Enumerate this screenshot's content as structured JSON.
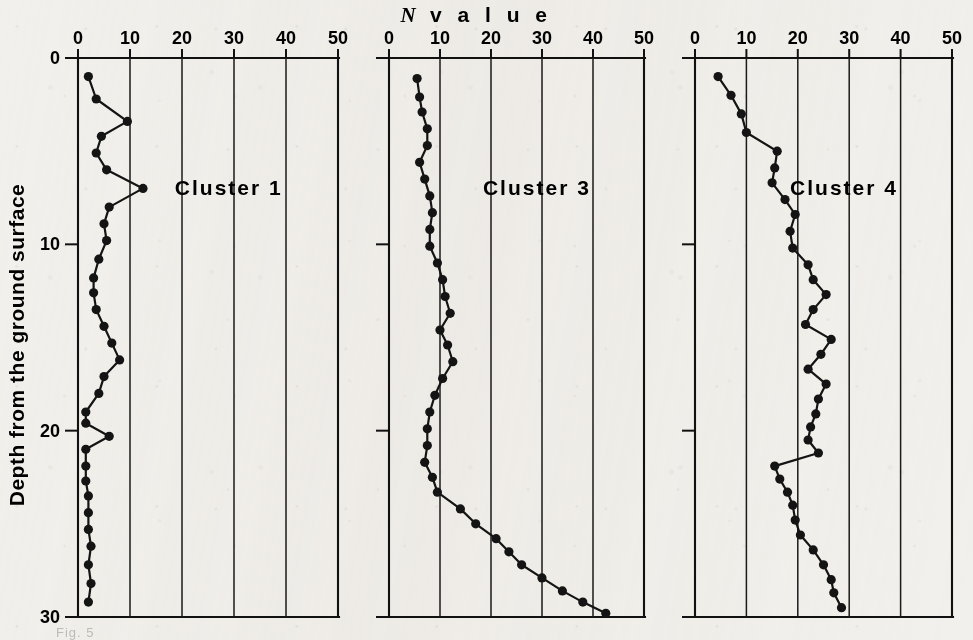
{
  "figure": {
    "title_italic": "N",
    "title_rest": "v a l u e",
    "ylabel": "Depth from the ground surface",
    "caption_partial": "Fig. 5"
  },
  "axis": {
    "x_ticks": [
      "0",
      "10",
      "20",
      "30",
      "40",
      "50"
    ],
    "x_tick_values": [
      0,
      10,
      20,
      30,
      40,
      50
    ],
    "y_ticks": [
      "0",
      "10",
      "20",
      "30"
    ],
    "y_tick_values": [
      0,
      10,
      20,
      30
    ],
    "xlim": [
      0,
      50
    ],
    "ylim": [
      0,
      30
    ],
    "colors": {
      "ink": "#141414",
      "paper": "#f2f0ec",
      "grid": "#1a1a1a"
    }
  },
  "chart_data": {
    "type": "line",
    "xlabel": "N value",
    "ylabel": "Depth from the ground surface",
    "xlim": [
      0,
      50
    ],
    "ylim": [
      0,
      30
    ],
    "y_inverted": true,
    "grid": true,
    "legend": "none",
    "panels": [
      {
        "label": "Cluster 1",
        "x": [
          2.0,
          3.5,
          9.5,
          4.5,
          3.5,
          5.5,
          12.5,
          6.0,
          5.0,
          5.5,
          4.0,
          3.0,
          3.0,
          3.5,
          5.0,
          6.5,
          8.0,
          5.0,
          4.0,
          1.5,
          1.5,
          6.0,
          1.5,
          1.5,
          1.5,
          2.0,
          2.0,
          2.0,
          2.5,
          2.0,
          2.5,
          2.0
        ],
        "y": [
          1.0,
          2.2,
          3.4,
          4.2,
          5.1,
          6.0,
          7.0,
          8.0,
          8.9,
          9.8,
          10.8,
          11.8,
          12.6,
          13.5,
          14.4,
          15.3,
          16.2,
          17.1,
          18.0,
          19.0,
          19.6,
          20.3,
          21.0,
          21.9,
          22.7,
          23.5,
          24.4,
          25.3,
          26.2,
          27.2,
          28.2,
          29.2
        ],
        "x_label_pos": 29,
        "y_label_pos": 7.0
      },
      {
        "label": "Cluster 3",
        "x": [
          5.5,
          6.0,
          6.5,
          7.5,
          7.5,
          6.0,
          7.0,
          8.0,
          8.5,
          8.0,
          8.0,
          9.5,
          10.5,
          11.0,
          12.0,
          10.0,
          11.5,
          12.5,
          10.5,
          9.0,
          8.0,
          7.5,
          7.5,
          7.0,
          8.5,
          9.5,
          14.0,
          17.0,
          21.0,
          23.5,
          26.0,
          30.0,
          34.0,
          38.0,
          42.5
        ],
        "y": [
          1.1,
          2.1,
          2.9,
          3.8,
          4.7,
          5.6,
          6.5,
          7.4,
          8.3,
          9.2,
          10.1,
          11.0,
          11.9,
          12.8,
          13.7,
          14.6,
          15.4,
          16.3,
          17.2,
          18.1,
          19.0,
          19.9,
          20.8,
          21.7,
          22.5,
          23.3,
          24.2,
          25.0,
          25.8,
          26.5,
          27.2,
          27.9,
          28.6,
          29.2,
          29.8
        ],
        "x_label_pos": 29,
        "y_label_pos": 7.0
      },
      {
        "label": "Cluster 4",
        "x": [
          4.5,
          7.0,
          9.0,
          10.0,
          16.0,
          15.5,
          15.0,
          17.5,
          19.5,
          18.5,
          19.0,
          22.0,
          23.0,
          25.5,
          23.0,
          21.5,
          26.5,
          24.5,
          22.0,
          25.5,
          24.0,
          23.5,
          22.5,
          22.0,
          24.0,
          15.5,
          16.5,
          18.0,
          19.0,
          19.5,
          20.5,
          23.0,
          25.0,
          26.5,
          27.0,
          28.5
        ],
        "y": [
          1.0,
          2.0,
          3.0,
          4.0,
          5.0,
          5.9,
          6.7,
          7.6,
          8.4,
          9.3,
          10.2,
          11.1,
          11.9,
          12.7,
          13.5,
          14.3,
          15.1,
          15.9,
          16.7,
          17.5,
          18.3,
          19.1,
          19.8,
          20.5,
          21.2,
          21.9,
          22.6,
          23.3,
          24.0,
          24.8,
          25.6,
          26.4,
          27.2,
          28.0,
          28.7,
          29.5
        ],
        "x_label_pos": 29,
        "y_label_pos": 7.0
      }
    ]
  }
}
